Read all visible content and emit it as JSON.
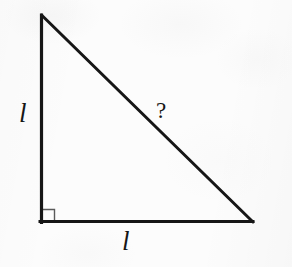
{
  "figure": {
    "background_color": "#fcfcfc",
    "stroke_color": "#161616",
    "right_angle_marker_color": "#5a5a5a",
    "labels": {
      "leg_vertical": "l",
      "leg_horizontal": "l",
      "hypotenuse": "?"
    },
    "geometry": {
      "shape": "right-triangle",
      "apex": [
        41,
        15
      ],
      "right_angle_vertex": [
        41,
        222
      ],
      "base_end": [
        253,
        222
      ],
      "leg_vertical_length_px": 207,
      "leg_horizontal_length_px": 212,
      "right_angle_marker_size_px": 13,
      "stroke_width_px": 3
    }
  }
}
